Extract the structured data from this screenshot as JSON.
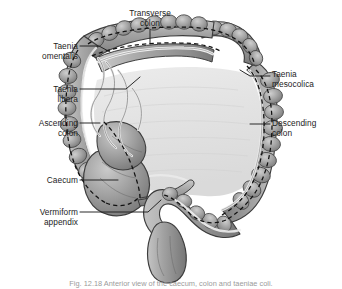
{
  "figure": {
    "caption": "Fig. 12.18 Anterior view of the caecum, colon and taeniae coli."
  },
  "colors": {
    "tissue": "#9b9b9b",
    "tissue_light": "#c6c6c6",
    "tissue_dark": "#6f6f6f",
    "interior": "#e2e2e2",
    "outline": "#3a3a3a",
    "taenia_dashed": "#111111",
    "taenia_band": "#f2f2f2",
    "label_text": "#1d1d1d",
    "leader_line": "#1d1d1d",
    "background": "#ffffff",
    "caption_text": "#9b9b9b"
  },
  "labels": [
    {
      "id": "transverse-colon",
      "name": "Transverse colon",
      "lines": [
        "Transverse",
        "colon"
      ],
      "side": "center",
      "leader": "vertical drop to transverse colon"
    },
    {
      "id": "taenia-omentalis",
      "name": "Taenia omentalis",
      "lines": [
        "Taenia",
        "omentalis"
      ],
      "side": "left",
      "leader": "to hepatic flexure / upper left colon"
    },
    {
      "id": "taenia-libera",
      "name": "Taenia libera",
      "lines": [
        "Taenia",
        "libera"
      ],
      "side": "left",
      "leader": "to anterior free band on transverse colon"
    },
    {
      "id": "ascending-colon",
      "name": "Ascending colon",
      "lines": [
        "Ascending",
        "colon"
      ],
      "side": "left",
      "leader": "to right vertical limb of colon"
    },
    {
      "id": "caecum",
      "name": "Caecum",
      "lines": [
        "Caecum"
      ],
      "side": "left",
      "leader": "to caecal pouch"
    },
    {
      "id": "vermiform-appendix",
      "name": "Vermiform appendix",
      "lines": [
        "Vermiform",
        "appendix"
      ],
      "side": "left",
      "leader": "to appendix below caecum"
    },
    {
      "id": "taenia-mesocolica",
      "name": "Taenia mesocolica",
      "lines": [
        "Taenia",
        "mesocolica"
      ],
      "side": "right",
      "leader": "to splenic flexure taenia"
    },
    {
      "id": "descending-colon",
      "name": "Descending colon",
      "lines": [
        "Descending",
        "colon"
      ],
      "side": "right",
      "leader": "to left vertical limb of colon"
    }
  ]
}
